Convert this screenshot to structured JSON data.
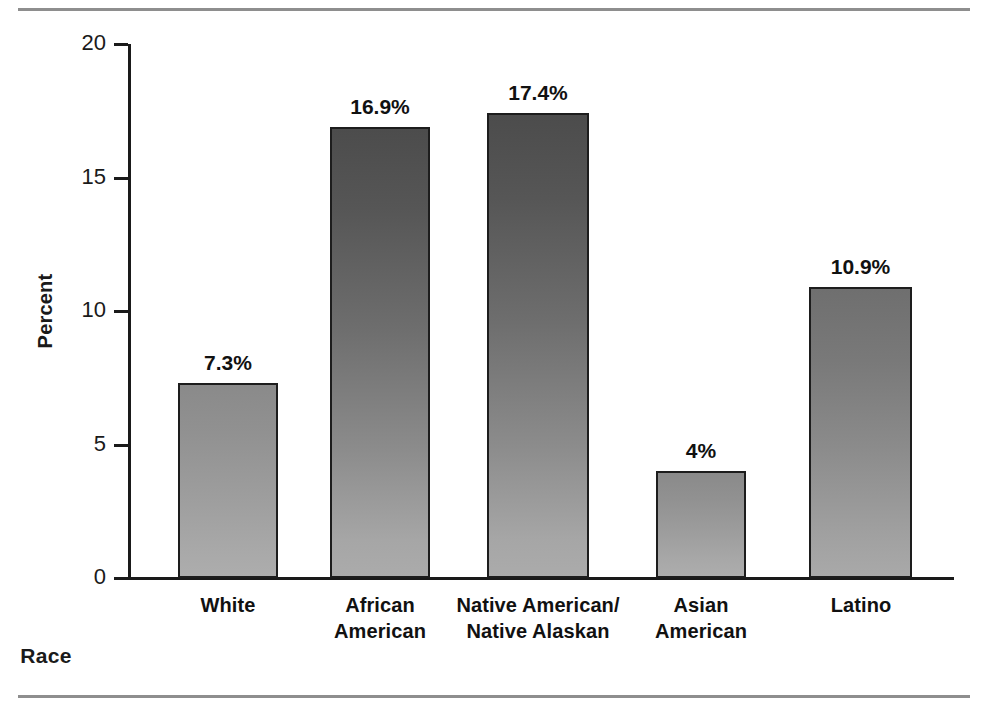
{
  "chart_data": {
    "type": "bar",
    "title": "",
    "subtitle": "",
    "xlabel": "Race",
    "ylabel": "Percent",
    "categories": [
      "White",
      "African American",
      "Native American/ Native Alaskan",
      "Asian American",
      "Latino"
    ],
    "category_lines": [
      [
        "White"
      ],
      [
        "African",
        "American"
      ],
      [
        "Native American/",
        "Native Alaskan"
      ],
      [
        "Asian",
        "American"
      ],
      [
        "Latino"
      ]
    ],
    "values": [
      7.3,
      16.9,
      17.4,
      4,
      10.9
    ],
    "value_labels": [
      "7.3%",
      "16.9%",
      "17.4%",
      "4%",
      "10.9%"
    ],
    "ylim": [
      0,
      20
    ],
    "yticks": [
      0,
      5,
      10,
      15,
      20
    ],
    "ytick_labels": [
      "0",
      "5",
      "10",
      "15",
      "20"
    ],
    "grid": false,
    "legend": "none",
    "orientation": "vertical"
  },
  "figure": {
    "bar_fill_dark": "#4c4c4c",
    "bar_fill_light": "#ababab",
    "bar_outline": "#1d1d1d",
    "axis_color": "#1a1a1a",
    "rule_color": "#8e8e8e",
    "background": "#ffffff"
  }
}
